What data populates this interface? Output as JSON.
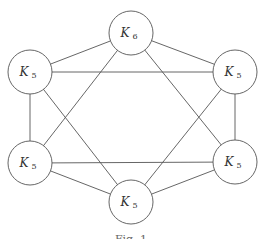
{
  "diagram": {
    "type": "graph",
    "nodes": [
      {
        "id": "top",
        "label": "K",
        "subscript": "6",
        "cx": 131,
        "cy": 33
      },
      {
        "id": "top-left",
        "label": "K",
        "subscript": "5",
        "cx": 30,
        "cy": 72
      },
      {
        "id": "top-right",
        "label": "K",
        "subscript": "5",
        "cx": 235,
        "cy": 72
      },
      {
        "id": "bottom-left",
        "label": "K",
        "subscript": "5",
        "cx": 30,
        "cy": 163
      },
      {
        "id": "bottom-right",
        "label": "K",
        "subscript": "5",
        "cx": 235,
        "cy": 162
      },
      {
        "id": "bottom",
        "label": "K",
        "subscript": "5",
        "cx": 131,
        "cy": 202
      }
    ],
    "edges": [
      [
        "top",
        "top-left"
      ],
      [
        "top",
        "top-right"
      ],
      [
        "top-left",
        "bottom-left"
      ],
      [
        "top-right",
        "bottom-right"
      ],
      [
        "bottom-left",
        "bottom"
      ],
      [
        "bottom-right",
        "bottom"
      ],
      [
        "top",
        "bottom-left"
      ],
      [
        "top",
        "bottom-right"
      ],
      [
        "bottom-left",
        "bottom-right"
      ],
      [
        "top-left",
        "top-right"
      ],
      [
        "top-left",
        "bottom"
      ],
      [
        "top-right",
        "bottom"
      ]
    ],
    "node_radius": 22,
    "caption": "Fig. 1"
  }
}
